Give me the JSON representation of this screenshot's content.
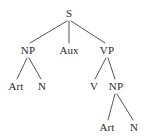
{
  "figure": {
    "kind": "syntax-parse-tree",
    "background_color": "#ffffff",
    "line_color": "#555555",
    "text_color": "#2b2b2b",
    "width": 146,
    "height": 140
  },
  "nodes": [
    {
      "id": "s",
      "label": "S",
      "x": 69,
      "y": 13,
      "level": 0
    },
    {
      "id": "np1",
      "label": "NP",
      "x": 28,
      "y": 50,
      "level": 1
    },
    {
      "id": "aux",
      "label": "Aux",
      "x": 69,
      "y": 50,
      "level": 1
    },
    {
      "id": "vp",
      "label": "VP",
      "x": 107,
      "y": 50,
      "level": 1
    },
    {
      "id": "art1",
      "label": "Art",
      "x": 16,
      "y": 86,
      "level": 2
    },
    {
      "id": "n1",
      "label": "N",
      "x": 42,
      "y": 86,
      "level": 2
    },
    {
      "id": "v",
      "label": "V",
      "x": 94,
      "y": 86,
      "level": 2
    },
    {
      "id": "np2",
      "label": "NP",
      "x": 116,
      "y": 86,
      "level": 2
    },
    {
      "id": "art2",
      "label": "Art",
      "x": 107,
      "y": 127,
      "level": 3
    },
    {
      "id": "n2",
      "label": "N",
      "x": 134,
      "y": 127,
      "level": 3
    }
  ],
  "edges": [
    {
      "from": "s",
      "to": "np1",
      "x1": 67,
      "y1": 21,
      "x2": 30,
      "y2": 43
    },
    {
      "from": "s",
      "to": "aux",
      "x1": 69,
      "y1": 21,
      "x2": 69,
      "y2": 43
    },
    {
      "from": "s",
      "to": "vp",
      "x1": 71,
      "y1": 21,
      "x2": 105,
      "y2": 43
    },
    {
      "from": "np1",
      "to": "art1",
      "x1": 27,
      "y1": 58,
      "x2": 17,
      "y2": 79
    },
    {
      "from": "np1",
      "to": "n1",
      "x1": 29,
      "y1": 58,
      "x2": 41,
      "y2": 79
    },
    {
      "from": "vp",
      "to": "v",
      "x1": 106,
      "y1": 58,
      "x2": 95,
      "y2": 79
    },
    {
      "from": "vp",
      "to": "np2",
      "x1": 108,
      "y1": 58,
      "x2": 115,
      "y2": 79
    },
    {
      "from": "np2",
      "to": "art2",
      "x1": 115,
      "y1": 94,
      "x2": 108,
      "y2": 120
    },
    {
      "from": "np2",
      "to": "n2",
      "x1": 117,
      "y1": 94,
      "x2": 133,
      "y2": 120
    }
  ]
}
